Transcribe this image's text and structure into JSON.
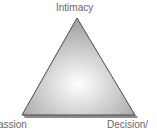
{
  "diagram": {
    "vertices": {
      "top": "Intimacy",
      "bottom_left": "assion",
      "bottom_right": "Decision/"
    },
    "colors": {
      "fill_center": "#ffffff",
      "fill_edge": "#a8a8a8",
      "outline": "#4a4a4a",
      "shadow": "#8c8c8c",
      "label": "#666666"
    }
  }
}
